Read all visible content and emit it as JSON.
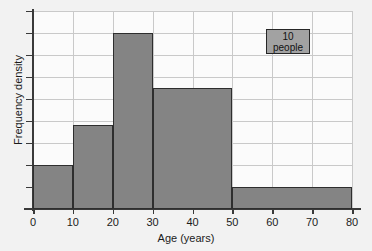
{
  "figure": {
    "top_artifact_text": "",
    "background_color": "#f2f2f2",
    "plot_background_color": "#fbfbfb"
  },
  "axes": {
    "x_label": "Age (years)",
    "y_label": "Frequency density",
    "x_ticks": [
      "0",
      "10",
      "20",
      "30",
      "40",
      "50",
      "60",
      "70",
      "80"
    ],
    "y_ticks": [
      "",
      "",
      "",
      "",
      "",
      "",
      "",
      "",
      ""
    ]
  },
  "key": {
    "value": "10",
    "unit": "people",
    "fill_color": "#a2a2a2",
    "border_color": "#262626"
  },
  "chart_data": {
    "type": "bar",
    "title": "",
    "subtitle": "",
    "xlabel": "Age (years)",
    "ylabel": "Frequency density",
    "xlim": [
      0,
      80
    ],
    "ylim": [
      0,
      9
    ],
    "grid": true,
    "legend": "10 people",
    "legend_position": "top-right",
    "bar_fill_color": "#848484",
    "bar_edge_color": "#2e2e2e",
    "x_tick_step": 10,
    "y_gridline_step": 1,
    "y_gridline_count": 9,
    "categories": [
      "0-10",
      "10-20",
      "20-30",
      "30-50",
      "50-80"
    ],
    "bins": [
      {
        "label": "0-10",
        "x_start": 0,
        "x_end": 10,
        "width": 10,
        "frequency_density": 2.0,
        "frequency": 20
      },
      {
        "label": "10-20",
        "x_start": 10,
        "x_end": 20,
        "width": 10,
        "frequency_density": 3.8,
        "frequency": 38
      },
      {
        "label": "20-30",
        "x_start": 20,
        "x_end": 30,
        "width": 10,
        "frequency_density": 8.0,
        "frequency": 80
      },
      {
        "label": "30-50",
        "x_start": 30,
        "x_end": 50,
        "width": 20,
        "frequency_density": 5.5,
        "frequency": 110
      },
      {
        "label": "50-80",
        "x_start": 50,
        "x_end": 80,
        "width": 30,
        "frequency_density": 1.0,
        "frequency": 30
      }
    ],
    "values": [
      2.0,
      3.8,
      8.0,
      5.5,
      1.0
    ]
  }
}
